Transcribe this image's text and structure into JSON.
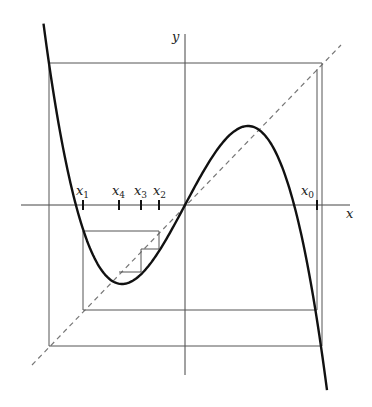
{
  "diagram": {
    "axes": {
      "x_label": "x",
      "y_label": "y"
    },
    "iterates": [
      {
        "name": "x",
        "sub": "0"
      },
      {
        "name": "x",
        "sub": "1"
      },
      {
        "name": "x",
        "sub": "2"
      },
      {
        "name": "x",
        "sub": "3"
      },
      {
        "name": "x",
        "sub": "4"
      }
    ],
    "curve": "odd cubic y = a·x − b·x³ (local max near x≈1, min near x≈−1)",
    "diagonal": "y = x (dashed)",
    "colors": {
      "curve": "#111111",
      "lines": "#555555",
      "dashed": "#777777"
    }
  }
}
